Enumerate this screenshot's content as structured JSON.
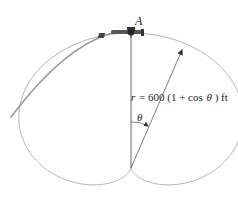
{
  "diagram": {
    "point_label": "A",
    "equation": {
      "r": "r",
      "equals": "= 600 (1 + cos",
      "theta": "θ",
      "close": ") ft"
    },
    "angle_label": "θ"
  },
  "colors": {
    "curve": "#a9a9a9",
    "flight_path": "#9a9a9a",
    "text": "#222222"
  }
}
